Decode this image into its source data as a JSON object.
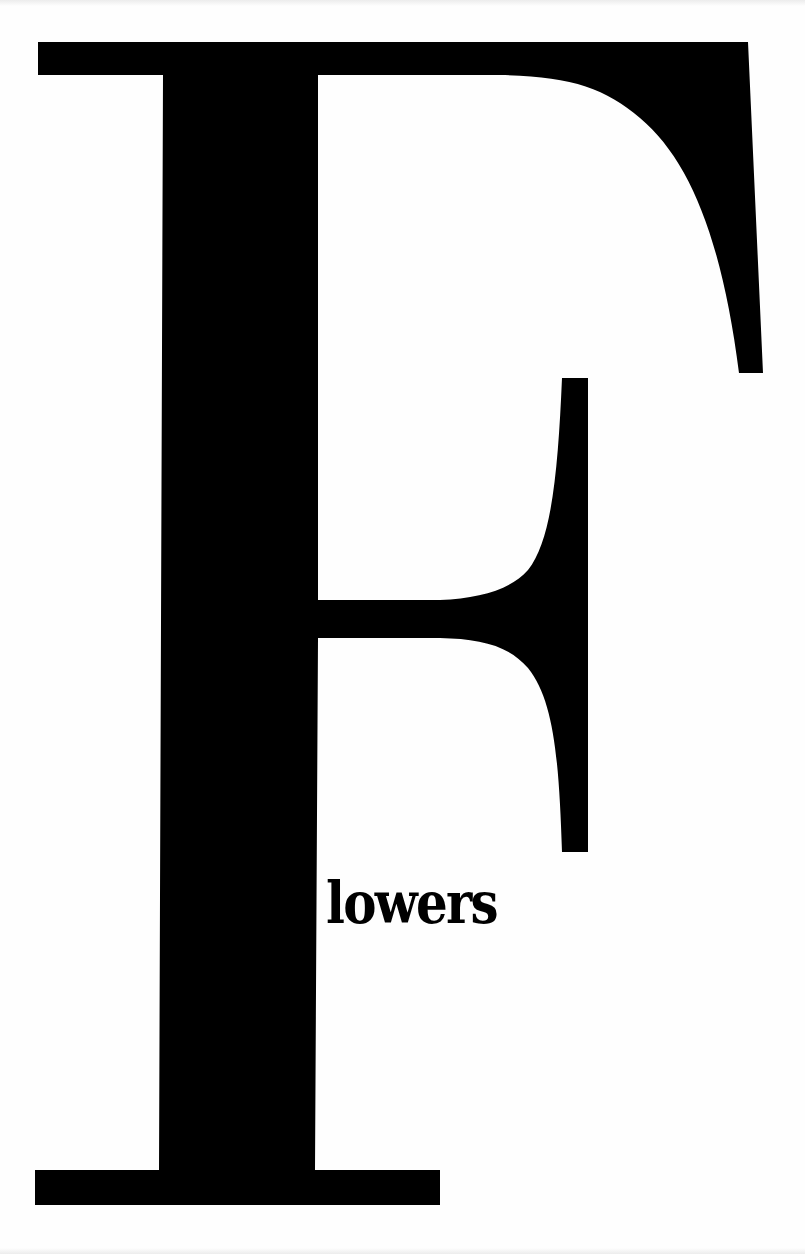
{
  "page": {
    "background": "#fefefe",
    "ink_color": "#000000"
  },
  "title": {
    "drop_cap_letter": "F",
    "rest_of_word": "lowers",
    "full_word": "Flowers"
  },
  "icons": {
    "drop_cap": "serif-capital-F-glyph"
  }
}
